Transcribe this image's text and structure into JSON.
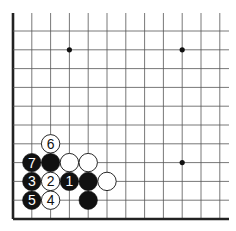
{
  "diagram": {
    "type": "go-board-fragment",
    "grid": {
      "origin_x": 13,
      "origin_y": 31,
      "spacing": 18.8,
      "columns": 12,
      "rows": 11,
      "left_edge": true,
      "bottom_edge": true,
      "top_open_to_y": 13,
      "right_open_to_x": 229
    },
    "star_points": [
      {
        "col": 3,
        "row": 1
      },
      {
        "col": 9,
        "row": 1
      },
      {
        "col": 9,
        "row": 7
      }
    ],
    "stones": [
      {
        "col": 2,
        "row": 6,
        "color": "white",
        "label": "6"
      },
      {
        "col": 1,
        "row": 7,
        "color": "black",
        "label": "7"
      },
      {
        "col": 2,
        "row": 7,
        "color": "black",
        "label": ""
      },
      {
        "col": 3,
        "row": 7,
        "color": "white",
        "label": ""
      },
      {
        "col": 4,
        "row": 7,
        "color": "white",
        "label": ""
      },
      {
        "col": 1,
        "row": 8,
        "color": "black",
        "label": "3"
      },
      {
        "col": 2,
        "row": 8,
        "color": "white",
        "label": "2"
      },
      {
        "col": 3,
        "row": 8,
        "color": "black",
        "label": "1"
      },
      {
        "col": 4,
        "row": 8,
        "color": "black",
        "label": ""
      },
      {
        "col": 5,
        "row": 8,
        "color": "white",
        "label": ""
      },
      {
        "col": 1,
        "row": 9,
        "color": "black",
        "label": "5"
      },
      {
        "col": 2,
        "row": 9,
        "color": "white",
        "label": "4"
      },
      {
        "col": 4,
        "row": 9,
        "color": "black",
        "label": ""
      }
    ],
    "colors": {
      "line": "#555555",
      "edge": "#222222",
      "black_stone": "#111111",
      "white_stone": "#ffffff",
      "star": "#111111"
    }
  }
}
